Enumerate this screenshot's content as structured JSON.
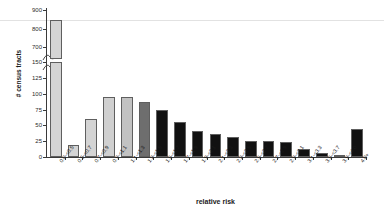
{
  "chart_data": {
    "type": "bar",
    "title": "",
    "xlabel": "relative risk",
    "ylabel": "# census tracts",
    "categories": [
      "0.0-<0.5",
      "0.5-<0.7",
      "0.7-<0.9",
      "0.9-<1.1",
      "1.1-<1.3",
      "1.3-<1.5",
      "1.5-<1.7",
      "1.7-<1.9",
      "1.9-<2.1",
      "2.1-<2.3",
      "2.3-<2.5",
      "2.5-<2.7",
      "2.7-<2.9",
      "2.9-<3.1",
      "3.1-<3.3",
      "3.5-<3.7",
      "3.9-<4.0",
      "4.0+"
    ],
    "values": [
      845,
      19,
      60,
      95,
      94,
      87,
      74,
      55,
      41,
      37,
      31,
      26,
      25,
      24,
      12,
      7,
      3,
      45
    ],
    "bar_colors": [
      "#d4d4d4",
      "#d4d4d4",
      "#d4d4d4",
      "#d0d0d0",
      "#c2c2c2",
      "#6e6e6e",
      "#111111",
      "#111111",
      "#111111",
      "#111111",
      "#111111",
      "#111111",
      "#111111",
      "#111111",
      "#111111",
      "#111111",
      "#111111",
      "#111111"
    ],
    "ylim_lower": [
      0,
      150
    ],
    "ylim_upper": [
      700,
      900
    ],
    "yticks_lower": [
      0,
      25,
      50,
      75,
      100,
      125,
      150
    ],
    "yticks_upper": [
      700,
      800,
      900
    ],
    "axis_break": true,
    "grid": false,
    "legend": false
  }
}
